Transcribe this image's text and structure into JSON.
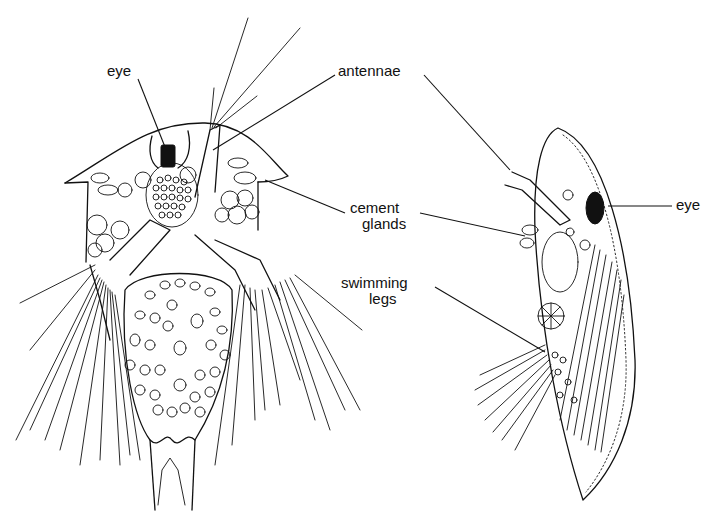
{
  "figure": {
    "left_specimen": {
      "labels": {
        "eye": "eye",
        "antennae": "antennae"
      }
    },
    "right_specimen": {
      "labels": {
        "eye": "eye",
        "cement_glands_line1": "cement",
        "cement_glands_line2": "glands",
        "swimming_legs_line1": "swimming",
        "swimming_legs_line2": "legs"
      }
    }
  }
}
